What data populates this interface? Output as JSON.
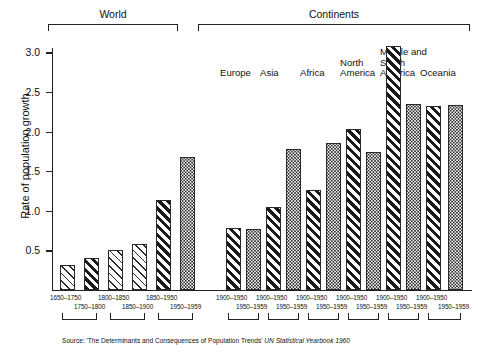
{
  "chart_data": {
    "type": "bar",
    "title": "",
    "xlabel": "",
    "ylabel": "Rate of population growth",
    "ylim": [
      0,
      3.25
    ],
    "yticks": [
      0.5,
      1.0,
      1.5,
      2.0,
      2.5,
      3.0
    ],
    "ytick_labels": [
      "0.5",
      "1.0",
      "1.5",
      "2.0",
      "2.5",
      "3.0"
    ],
    "grid": false,
    "legend": "none",
    "groups": [
      {
        "name": "World",
        "bars": [
          {
            "period": "1650–1750",
            "value": 0.32,
            "pattern": "hatch-light"
          },
          {
            "period": "1750–1800",
            "value": 0.4,
            "pattern": "hatch-bold"
          },
          {
            "period": "1800–1850",
            "value": 0.5,
            "pattern": "hatch-light"
          },
          {
            "period": "1850–1900",
            "value": 0.58,
            "pattern": "hatch-light"
          },
          {
            "period": "1850–1950",
            "value": 1.14,
            "pattern": "hatch-bold"
          },
          {
            "period": "1950–1959",
            "value": 1.68,
            "pattern": "dots"
          }
        ]
      },
      {
        "name": "Continents",
        "subgroups": [
          {
            "name": "Europe",
            "bars": [
              {
                "period": "1900–1950",
                "value": 0.78,
                "pattern": "hatch-bold"
              },
              {
                "period": "1950–1959",
                "value": 0.77,
                "pattern": "dots"
              }
            ]
          },
          {
            "name": "Asia",
            "bars": [
              {
                "period": "1900–1950",
                "value": 1.05,
                "pattern": "hatch-bold"
              },
              {
                "period": "1950–1959",
                "value": 1.78,
                "pattern": "dots"
              }
            ]
          },
          {
            "name": "Africa",
            "bars": [
              {
                "period": "1900–1950",
                "value": 1.26,
                "pattern": "hatch-bold"
              },
              {
                "period": "1950–1959",
                "value": 1.86,
                "pattern": "dots"
              }
            ]
          },
          {
            "name": "North\nAmerica",
            "bars": [
              {
                "period": "1900–1950",
                "value": 2.03,
                "pattern": "hatch-bold"
              },
              {
                "period": "1950–1959",
                "value": 1.74,
                "pattern": "dots"
              }
            ]
          },
          {
            "name": "Middle and\nSouth\nAmerica",
            "bars": [
              {
                "period": "1900–1950",
                "value": 3.08,
                "pattern": "hatch-bold"
              },
              {
                "period": "1950–1959",
                "value": 2.35,
                "pattern": "dots"
              }
            ]
          },
          {
            "name": "Oceania",
            "bars": [
              {
                "period": "1900–1950",
                "value": 2.32,
                "pattern": "hatch-bold"
              },
              {
                "period": "1950–1959",
                "value": 2.34,
                "pattern": "dots"
              }
            ]
          }
        ]
      }
    ]
  },
  "headers": {
    "world": "World",
    "continents": "Continents"
  },
  "continent_labels": [
    "Europe",
    "Asia",
    "Africa",
    "North\nAmerica",
    "Middle and\nSouth\nAmerica",
    "Oceania"
  ],
  "source": {
    "prefix": "Source: 'The Determinants and Consequences of Population Trends' ",
    "italic": "UN Statistical Yearbook 1960"
  },
  "colors": {
    "ink": "#1a1a1a",
    "axis": "#222222",
    "dots_bg": "#f2f2f2"
  }
}
